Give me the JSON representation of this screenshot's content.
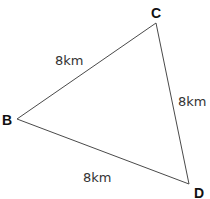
{
  "diagram": {
    "type": "triangle",
    "vertices": [
      {
        "id": "B",
        "label": "B"
      },
      {
        "id": "C",
        "label": "C"
      },
      {
        "id": "D",
        "label": "D"
      }
    ],
    "edges": [
      {
        "from": "B",
        "to": "C",
        "label": "8km",
        "length_km": 8
      },
      {
        "from": "C",
        "to": "D",
        "label": "8km",
        "length_km": 8
      },
      {
        "from": "B",
        "to": "D",
        "label": "8km",
        "length_km": 8
      }
    ]
  }
}
